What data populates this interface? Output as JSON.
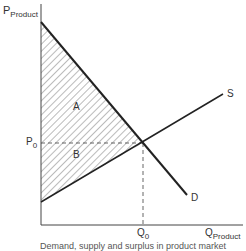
{
  "axes": {
    "y_label_main": "P",
    "y_label_sub": "Product",
    "x_label_main": "Q",
    "x_label_sub": "Product"
  },
  "curves": {
    "supply": "S",
    "demand": "D"
  },
  "equilibrium": {
    "price_main": "P",
    "price_sub": "0",
    "quantity_main": "Q",
    "quantity_sub": "0"
  },
  "areas": {
    "consumer_surplus": "A",
    "producer_surplus": "B"
  },
  "caption": "Demand, supply and surplus in product market"
}
